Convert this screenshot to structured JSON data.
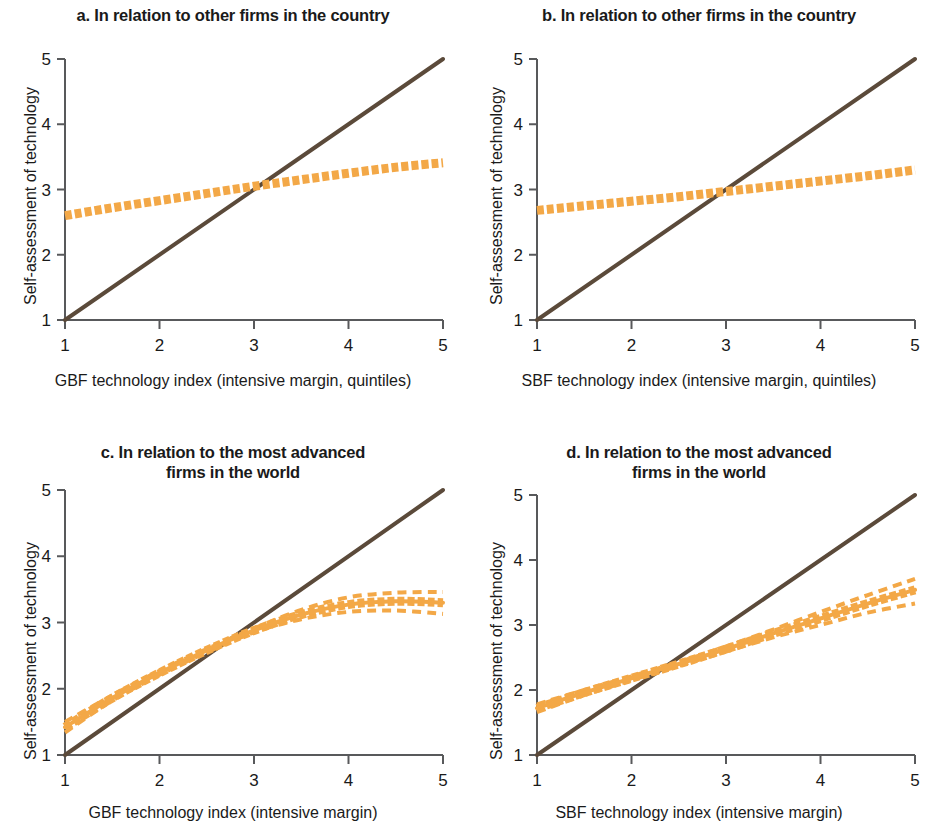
{
  "figure": {
    "panel_count": 4,
    "colors": {
      "fit_line": "#F3A847",
      "reference_line": "#5B4A3A",
      "axis": "#58595B",
      "text": "#1a1a1a",
      "background": "#FFFFFF"
    }
  },
  "panels": [
    {
      "key": "a",
      "title": "a. In relation to other firms in the country",
      "title_lines": [
        "a. In relation to other firms in the country"
      ],
      "xlabel": "GBF technology index (intensive margin, quintiles)",
      "ylabel": "Self-assessment of technology",
      "xticks": [
        "1",
        "2",
        "3",
        "4",
        "5"
      ],
      "yticks": [
        "1",
        "2",
        "3",
        "4",
        "5"
      ]
    },
    {
      "key": "b",
      "title": "b. In relation to other firms in the country",
      "title_lines": [
        "b. In relation to other firms in the country"
      ],
      "xlabel": "SBF technology index (intensive margin, quintiles)",
      "ylabel": "Self-assessment of technology",
      "xticks": [
        "1",
        "2",
        "3",
        "4",
        "5"
      ],
      "yticks": [
        "1",
        "2",
        "3",
        "4",
        "5"
      ]
    },
    {
      "key": "c",
      "title": "c. In relation to the most advanced firms in the world",
      "title_lines": [
        "c. In relation to the most advanced",
        "firms in the world"
      ],
      "xlabel": "GBF technology index (intensive margin)",
      "ylabel": "Self-assessment of technology",
      "xticks": [
        "1",
        "2",
        "3",
        "4",
        "5"
      ],
      "yticks": [
        "1",
        "2",
        "3",
        "4",
        "5"
      ]
    },
    {
      "key": "d",
      "title": "d. In relation to the most advanced firms in the world",
      "title_lines": [
        "d. In relation to the most advanced",
        "firms in the world"
      ],
      "xlabel": "SBF technology index (intensive margin)",
      "ylabel": "Self-assessment of technology",
      "xticks": [
        "1",
        "2",
        "3",
        "4",
        "5"
      ],
      "yticks": [
        "1",
        "2",
        "3",
        "4",
        "5"
      ]
    }
  ],
  "chart_data": [
    {
      "panel": "a",
      "type": "line",
      "title": "a. In relation to other firms in the country",
      "xlabel": "GBF technology index (intensive margin, quintiles)",
      "ylabel": "Self-assessment of technology",
      "xlim": [
        1,
        5
      ],
      "ylim": [
        1,
        5
      ],
      "xticks": [
        1,
        2,
        3,
        4,
        5
      ],
      "yticks": [
        1,
        2,
        3,
        4,
        5
      ],
      "grid": false,
      "legend": "none",
      "series": [
        {
          "name": "45-degree reference line",
          "style": "solid",
          "color": "#5B4A3A",
          "x": [
            1,
            5
          ],
          "values": [
            1,
            5
          ]
        },
        {
          "name": "Fitted self-assessment (with confidence band)",
          "style": "thick-dashed",
          "color": "#F3A847",
          "x": [
            1,
            1.5,
            2,
            2.5,
            3,
            3.5,
            4,
            4.5,
            5
          ],
          "values": [
            2.6,
            2.72,
            2.83,
            2.94,
            3.05,
            3.15,
            3.25,
            3.34,
            3.41
          ]
        }
      ]
    },
    {
      "panel": "b",
      "type": "line",
      "title": "b. In relation to other firms in the country",
      "xlabel": "SBF technology index (intensive margin, quintiles)",
      "ylabel": "Self-assessment of technology",
      "xlim": [
        1,
        5
      ],
      "ylim": [
        1,
        5
      ],
      "xticks": [
        1,
        2,
        3,
        4,
        5
      ],
      "yticks": [
        1,
        2,
        3,
        4,
        5
      ],
      "grid": false,
      "legend": "none",
      "series": [
        {
          "name": "45-degree reference line",
          "style": "solid",
          "color": "#5B4A3A",
          "x": [
            1,
            5
          ],
          "values": [
            1,
            5
          ]
        },
        {
          "name": "Fitted self-assessment (with confidence band)",
          "style": "thick-dashed",
          "color": "#F3A847",
          "x": [
            1,
            1.5,
            2,
            2.5,
            3,
            3.5,
            4,
            4.5,
            5
          ],
          "values": [
            2.68,
            2.75,
            2.82,
            2.89,
            2.97,
            3.05,
            3.13,
            3.21,
            3.3
          ]
        }
      ]
    },
    {
      "panel": "c",
      "type": "line",
      "title": "c. In relation to the most advanced firms in the world",
      "xlabel": "GBF technology index (intensive margin)",
      "ylabel": "Self-assessment of technology",
      "xlim": [
        1,
        5
      ],
      "ylim": [
        1,
        5
      ],
      "xticks": [
        1,
        2,
        3,
        4,
        5
      ],
      "yticks": [
        1,
        2,
        3,
        4,
        5
      ],
      "grid": false,
      "legend": "none",
      "series": [
        {
          "name": "45-degree reference line",
          "style": "solid",
          "color": "#5B4A3A",
          "x": [
            1,
            5
          ],
          "values": [
            1,
            5
          ]
        },
        {
          "name": "Fitted self-assessment",
          "style": "thick-dashed",
          "color": "#F3A847",
          "x": [
            1,
            1.5,
            2,
            2.5,
            3,
            3.5,
            4,
            4.5,
            5
          ],
          "values": [
            1.42,
            1.86,
            2.24,
            2.58,
            2.88,
            3.12,
            3.27,
            3.32,
            3.3
          ]
        },
        {
          "name": "Upper confidence bound",
          "style": "dashed",
          "color": "#F3A847",
          "x": [
            1,
            1.5,
            2,
            2.5,
            3,
            3.5,
            4,
            4.5,
            5
          ],
          "values": [
            1.5,
            1.9,
            2.27,
            2.6,
            2.91,
            3.19,
            3.38,
            3.45,
            3.46
          ]
        },
        {
          "name": "Lower confidence bound",
          "style": "dashed",
          "color": "#F3A847",
          "x": [
            1,
            1.5,
            2,
            2.5,
            3,
            3.5,
            4,
            4.5,
            5
          ],
          "values": [
            1.34,
            1.82,
            2.21,
            2.55,
            2.85,
            3.05,
            3.16,
            3.18,
            3.13
          ]
        }
      ]
    },
    {
      "panel": "d",
      "type": "line",
      "title": "d. In relation to the most advanced firms in the world",
      "xlabel": "SBF technology index (intensive margin)",
      "ylabel": "Self-assessment of technology",
      "xlim": [
        1,
        5
      ],
      "ylim": [
        1,
        5
      ],
      "xticks": [
        1,
        2,
        3,
        4,
        5
      ],
      "yticks": [
        1,
        2,
        3,
        4,
        5
      ],
      "grid": false,
      "legend": "none",
      "series": [
        {
          "name": "45-degree reference line",
          "style": "solid",
          "color": "#5B4A3A",
          "x": [
            1,
            5
          ],
          "values": [
            1,
            5
          ]
        },
        {
          "name": "Fitted self-assessment",
          "style": "thick-dashed",
          "color": "#F3A847",
          "x": [
            1,
            1.5,
            2,
            2.5,
            3,
            3.5,
            4,
            4.5,
            5
          ],
          "values": [
            1.72,
            1.96,
            2.18,
            2.4,
            2.63,
            2.87,
            3.1,
            3.33,
            3.54
          ]
        },
        {
          "name": "Upper confidence bound",
          "style": "dashed",
          "color": "#F3A847",
          "x": [
            1,
            1.5,
            2,
            2.5,
            3,
            3.5,
            4,
            4.5,
            5
          ],
          "values": [
            1.78,
            2.0,
            2.21,
            2.43,
            2.67,
            2.93,
            3.2,
            3.46,
            3.71
          ]
        },
        {
          "name": "Lower confidence bound",
          "style": "dashed",
          "color": "#F3A847",
          "x": [
            1,
            1.5,
            2,
            2.5,
            3,
            3.5,
            4,
            4.5,
            5
          ],
          "values": [
            1.66,
            1.92,
            2.15,
            2.37,
            2.59,
            2.81,
            3.0,
            3.19,
            3.33
          ]
        }
      ]
    }
  ]
}
